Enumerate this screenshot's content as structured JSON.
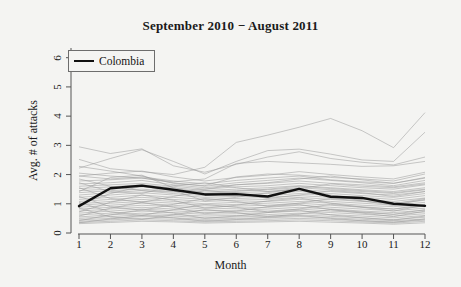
{
  "figure": {
    "width": 461,
    "height": 287,
    "background_color": "#f4f4f2"
  },
  "chart_data": {
    "type": "line",
    "title": "September 2010 − August 2011",
    "xlabel": "Month",
    "ylabel": "Avg. # of attacks",
    "xlim": [
      1,
      12
    ],
    "ylim": [
      0,
      6.4
    ],
    "x": [
      1,
      2,
      3,
      4,
      5,
      6,
      7,
      8,
      9,
      10,
      11,
      12
    ],
    "xticks": [
      "1",
      "2",
      "3",
      "4",
      "5",
      "6",
      "7",
      "8",
      "9",
      "10",
      "11",
      "12"
    ],
    "yticks": [
      "0",
      "1",
      "2",
      "3",
      "4",
      "5",
      "6"
    ],
    "grid": false,
    "legend_position": "top-left",
    "highlight_color": "#111111",
    "background_series_color": "#9a9a9a",
    "legend": [
      {
        "name": "Colombia",
        "color": "#111111",
        "highlighted": true
      }
    ],
    "series": [
      {
        "name": "Colombia",
        "highlighted": true,
        "color": "#111111",
        "values": [
          0.92,
          1.53,
          1.62,
          1.48,
          1.32,
          1.33,
          1.25,
          1.51,
          1.24,
          1.2,
          1.0,
          0.93
        ]
      },
      {
        "name": "background-1",
        "highlighted": false,
        "values": [
          2.95,
          2.72,
          2.88,
          2.3,
          2.08,
          2.35,
          2.6,
          2.78,
          2.55,
          2.42,
          2.33,
          2.6
        ]
      },
      {
        "name": "background-2",
        "highlighted": false,
        "values": [
          2.22,
          2.55,
          2.85,
          2.45,
          2.02,
          2.45,
          2.82,
          2.87,
          2.7,
          2.5,
          2.45,
          3.45
        ]
      },
      {
        "name": "background-3",
        "highlighted": false,
        "values": [
          2.52,
          2.2,
          2.1,
          2.0,
          2.25,
          3.1,
          3.35,
          3.62,
          3.92,
          3.5,
          2.92,
          4.12
        ]
      },
      {
        "name": "background-4",
        "highlighted": false,
        "values": [
          2.28,
          2.12,
          1.95,
          1.7,
          1.62,
          1.92,
          2.02,
          1.98,
          1.9,
          1.85,
          1.78,
          2.02
        ]
      },
      {
        "name": "background-5",
        "highlighted": false,
        "values": [
          2.05,
          1.95,
          1.88,
          1.75,
          1.85,
          2.38,
          2.45,
          2.4,
          2.35,
          2.28,
          2.3,
          2.45
        ]
      },
      {
        "name": "background-6",
        "highlighted": false,
        "values": [
          1.95,
          1.85,
          1.92,
          1.78,
          1.68,
          1.8,
          1.88,
          1.95,
          1.82,
          1.75,
          1.7,
          1.9
        ]
      },
      {
        "name": "background-7",
        "highlighted": false,
        "values": [
          1.78,
          1.82,
          1.88,
          1.72,
          1.6,
          1.72,
          1.8,
          1.88,
          1.8,
          1.72,
          1.62,
          1.8
        ]
      },
      {
        "name": "background-8",
        "highlighted": false,
        "values": [
          1.68,
          1.72,
          1.8,
          1.65,
          1.55,
          1.65,
          1.7,
          1.78,
          1.7,
          1.65,
          1.58,
          1.72
        ]
      },
      {
        "name": "background-9",
        "highlighted": false,
        "values": [
          1.6,
          1.65,
          1.7,
          1.6,
          1.5,
          1.58,
          1.62,
          1.7,
          1.62,
          1.55,
          1.5,
          1.65
        ]
      },
      {
        "name": "background-10",
        "highlighted": false,
        "values": [
          1.52,
          1.58,
          1.65,
          1.55,
          1.45,
          1.5,
          1.55,
          1.62,
          1.55,
          1.48,
          1.42,
          1.55
        ]
      },
      {
        "name": "background-11",
        "highlighted": false,
        "values": [
          1.45,
          1.5,
          1.58,
          1.48,
          1.4,
          1.45,
          1.48,
          1.55,
          1.48,
          1.42,
          1.35,
          1.48
        ]
      },
      {
        "name": "background-12",
        "highlighted": false,
        "values": [
          1.38,
          1.45,
          1.5,
          1.42,
          1.35,
          1.38,
          1.42,
          1.48,
          1.42,
          1.35,
          1.3,
          1.42
        ]
      },
      {
        "name": "background-13",
        "highlighted": false,
        "values": [
          1.3,
          1.38,
          1.45,
          1.35,
          1.28,
          1.32,
          1.35,
          1.42,
          1.35,
          1.28,
          1.22,
          1.35
        ]
      },
      {
        "name": "background-14",
        "highlighted": false,
        "values": [
          1.22,
          1.3,
          1.38,
          1.3,
          1.22,
          1.25,
          1.28,
          1.35,
          1.28,
          1.22,
          1.15,
          1.28
        ]
      },
      {
        "name": "background-15",
        "highlighted": false,
        "values": [
          1.15,
          1.22,
          1.3,
          1.22,
          1.15,
          1.18,
          1.22,
          1.28,
          1.22,
          1.15,
          1.08,
          1.2
        ]
      },
      {
        "name": "background-16",
        "highlighted": false,
        "values": [
          1.08,
          1.15,
          1.22,
          1.15,
          1.08,
          1.12,
          1.15,
          1.22,
          1.15,
          1.08,
          1.02,
          1.12
        ]
      },
      {
        "name": "background-17",
        "highlighted": false,
        "values": [
          1.0,
          1.08,
          1.15,
          1.08,
          1.0,
          1.05,
          1.08,
          1.15,
          1.08,
          1.02,
          0.95,
          1.05
        ]
      },
      {
        "name": "background-18",
        "highlighted": false,
        "values": [
          0.95,
          1.02,
          1.08,
          1.02,
          0.95,
          0.98,
          1.02,
          1.08,
          1.02,
          0.95,
          0.9,
          0.98
        ]
      },
      {
        "name": "background-19",
        "highlighted": false,
        "values": [
          0.88,
          0.95,
          1.02,
          0.95,
          0.88,
          0.92,
          0.95,
          1.02,
          0.95,
          0.88,
          0.82,
          0.92
        ]
      },
      {
        "name": "background-20",
        "highlighted": false,
        "values": [
          0.82,
          0.88,
          0.95,
          0.9,
          0.82,
          0.85,
          0.88,
          0.95,
          0.88,
          0.82,
          0.76,
          0.85
        ]
      },
      {
        "name": "background-21",
        "highlighted": false,
        "values": [
          0.75,
          0.82,
          0.88,
          0.82,
          0.76,
          0.78,
          0.82,
          0.88,
          0.82,
          0.75,
          0.7,
          0.78
        ]
      },
      {
        "name": "background-22",
        "highlighted": false,
        "values": [
          0.68,
          0.75,
          0.82,
          0.76,
          0.7,
          0.72,
          0.75,
          0.82,
          0.75,
          0.7,
          0.64,
          0.72
        ]
      },
      {
        "name": "background-23",
        "highlighted": false,
        "values": [
          0.62,
          0.68,
          0.75,
          0.7,
          0.64,
          0.66,
          0.7,
          0.75,
          0.7,
          0.64,
          0.58,
          0.66
        ]
      },
      {
        "name": "background-24",
        "highlighted": false,
        "values": [
          0.55,
          0.62,
          0.68,
          0.63,
          0.58,
          0.6,
          0.63,
          0.68,
          0.63,
          0.58,
          0.52,
          0.6
        ]
      },
      {
        "name": "background-25",
        "highlighted": false,
        "values": [
          0.5,
          0.56,
          0.62,
          0.58,
          0.52,
          0.55,
          0.58,
          0.62,
          0.57,
          0.52,
          0.46,
          0.54
        ]
      },
      {
        "name": "background-26",
        "highlighted": false,
        "values": [
          0.45,
          0.5,
          0.56,
          0.52,
          0.47,
          0.5,
          0.52,
          0.56,
          0.52,
          0.47,
          0.42,
          0.48
        ]
      },
      {
        "name": "background-27",
        "highlighted": false,
        "values": [
          0.4,
          0.45,
          0.5,
          0.47,
          0.43,
          0.45,
          0.47,
          0.5,
          0.47,
          0.42,
          0.38,
          0.44
        ]
      },
      {
        "name": "background-28",
        "highlighted": false,
        "values": [
          0.36,
          0.4,
          0.45,
          0.42,
          0.38,
          0.4,
          0.42,
          0.45,
          0.42,
          0.38,
          0.34,
          0.4
        ]
      },
      {
        "name": "background-29",
        "highlighted": false,
        "values": [
          0.32,
          0.36,
          0.4,
          0.38,
          0.34,
          0.36,
          0.38,
          0.4,
          0.37,
          0.34,
          0.3,
          0.35
        ]
      },
      {
        "name": "background-30",
        "highlighted": false,
        "values": [
          1.85,
          1.6,
          1.45,
          1.4,
          1.5,
          1.65,
          1.72,
          1.85,
          1.95,
          1.82,
          1.7,
          1.88
        ]
      },
      {
        "name": "background-31",
        "highlighted": false,
        "values": [
          1.42,
          1.9,
          1.98,
          1.55,
          1.35,
          1.42,
          1.5,
          1.6,
          1.52,
          1.45,
          1.38,
          1.5
        ]
      },
      {
        "name": "background-32",
        "highlighted": false,
        "values": [
          1.72,
          1.42,
          1.35,
          1.62,
          1.72,
          1.55,
          1.42,
          1.52,
          1.68,
          1.6,
          1.55,
          1.68
        ]
      },
      {
        "name": "background-33",
        "highlighted": false,
        "values": [
          0.98,
          1.35,
          1.6,
          1.45,
          1.1,
          1.22,
          1.38,
          1.52,
          1.3,
          1.1,
          0.95,
          1.15
        ]
      },
      {
        "name": "background-34",
        "highlighted": false,
        "values": [
          1.55,
          1.18,
          1.05,
          1.25,
          1.45,
          1.38,
          1.18,
          1.3,
          1.45,
          1.38,
          1.25,
          1.42
        ]
      },
      {
        "name": "background-35",
        "highlighted": false,
        "values": [
          0.72,
          1.05,
          1.3,
          1.12,
          0.85,
          0.95,
          1.1,
          1.2,
          1.02,
          0.88,
          0.75,
          0.95
        ]
      },
      {
        "name": "background-36",
        "highlighted": false,
        "values": [
          1.25,
          0.9,
          0.78,
          0.98,
          1.18,
          1.08,
          0.92,
          1.02,
          1.18,
          1.1,
          1.0,
          1.18
        ]
      },
      {
        "name": "background-37",
        "highlighted": false,
        "values": [
          0.58,
          0.85,
          1.05,
          0.88,
          0.66,
          0.75,
          0.9,
          0.98,
          0.8,
          0.68,
          0.56,
          0.75
        ]
      },
      {
        "name": "background-38",
        "highlighted": false,
        "values": [
          1.05,
          0.72,
          0.6,
          0.8,
          0.98,
          0.88,
          0.72,
          0.82,
          0.98,
          0.9,
          0.82,
          0.98
        ]
      },
      {
        "name": "background-39",
        "highlighted": false,
        "values": [
          0.42,
          0.62,
          0.8,
          0.68,
          0.5,
          0.58,
          0.7,
          0.78,
          0.62,
          0.52,
          0.44,
          0.58
        ]
      },
      {
        "name": "background-40",
        "highlighted": false,
        "values": [
          0.85,
          0.55,
          0.46,
          0.62,
          0.8,
          0.7,
          0.56,
          0.65,
          0.8,
          0.72,
          0.64,
          0.8
        ]
      },
      {
        "name": "background-41",
        "highlighted": false,
        "values": [
          1.95,
          2.05,
          2.12,
          1.92,
          1.78,
          1.9,
          1.98,
          2.1,
          2.0,
          1.92,
          1.85,
          2.08
        ]
      },
      {
        "name": "background-42",
        "highlighted": false,
        "values": [
          0.35,
          0.48,
          0.6,
          0.52,
          0.4,
          0.46,
          0.54,
          0.6,
          0.5,
          0.42,
          0.36,
          0.48
        ]
      }
    ]
  },
  "legend": {
    "entries": [
      {
        "label": "Colombia"
      }
    ]
  }
}
